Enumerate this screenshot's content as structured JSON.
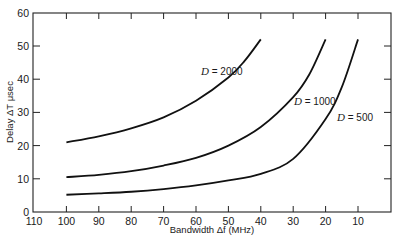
{
  "chart_data": {
    "type": "line",
    "title": "",
    "xlabel": "Bandwidth Δf (MHz)",
    "ylabel": "Delay ΔT μsec",
    "xlim": [
      110,
      0
    ],
    "ylim": [
      0,
      60
    ],
    "x_reversed": true,
    "x_ticks": [
      110,
      100,
      90,
      80,
      70,
      60,
      50,
      40,
      30,
      20,
      10
    ],
    "y_ticks": [
      0,
      10,
      20,
      30,
      40,
      50,
      60
    ],
    "grid": false,
    "legend": "inline labels",
    "series": [
      {
        "name": "D = 2000",
        "label_prefix": "D",
        "label_value": "= 2000",
        "x": [
          100,
          90,
          80,
          70,
          60,
          50,
          45,
          40
        ],
        "y": [
          21,
          22.8,
          25.2,
          28.5,
          33.5,
          40.5,
          45.5,
          52
        ]
      },
      {
        "name": "D = 1000",
        "label_prefix": "D",
        "label_value": "= 1000",
        "x": [
          100,
          90,
          80,
          70,
          60,
          50,
          40,
          30,
          25,
          20
        ],
        "y": [
          10.5,
          11.2,
          12.3,
          14,
          16.3,
          20,
          25.6,
          34.6,
          41.5,
          52
        ]
      },
      {
        "name": "D = 500",
        "label_prefix": "D",
        "label_value": "= 500",
        "x": [
          100,
          90,
          80,
          70,
          60,
          50,
          40,
          30,
          20,
          15,
          10
        ],
        "y": [
          5.2,
          5.6,
          6.1,
          6.9,
          8.0,
          9.5,
          11.5,
          16,
          28,
          37.6,
          52
        ]
      }
    ]
  },
  "labels": {
    "xlabel": "Bandwidth Δf (MHz)",
    "ylabel": "Delay ΔT μsec"
  }
}
